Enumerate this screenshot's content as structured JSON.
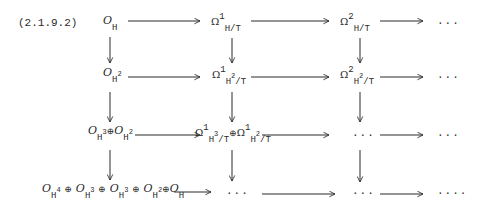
{
  "equation_label": "(2.1.9.2)",
  "diagram": {
    "type": "commutative-diagram",
    "rows": [
      {
        "nodes": [
          {
            "main": "O",
            "sub": "H",
            "sub_sup": ""
          },
          {
            "main": "Ω",
            "sup": "1",
            "sub": "H/T"
          },
          {
            "main": "Ω",
            "sup": "2",
            "sub": "H/T"
          },
          {
            "text": "..."
          }
        ]
      },
      {
        "nodes": [
          {
            "main": "O",
            "sub": "H",
            "sub_sup": "2"
          },
          {
            "main": "Ω",
            "sup": "1",
            "sub": "H",
            "sub_sup": "2",
            "sub_tail": "/T"
          },
          {
            "main": "Ω",
            "sup": "2",
            "sub": "H",
            "sub_sup": "2",
            "sub_tail": "/T"
          },
          {
            "text": "..."
          }
        ]
      },
      {
        "nodes": [
          {
            "text": "O_{H^3} ⊕ O_{H^2}"
          },
          {
            "text": "Ω¹_{H^3/T} ⊕ Ω¹_{H^2/T}"
          },
          {
            "text": "..."
          },
          {
            "text": "..."
          }
        ]
      },
      {
        "nodes": [
          {
            "text": "O_{H^4} ⊕ O_{H^3} ⊕ O_{H^3} ⊕ O_{H^2} ⊕ O_H"
          },
          {
            "text": "..."
          },
          {
            "text": "..."
          },
          {
            "text": "...."
          }
        ]
      }
    ],
    "symbols": {
      "O": "O",
      "Omega": "Ω",
      "H": "H",
      "T": "T",
      "oplus": "⊕",
      "slash_T": "/T",
      "dots": "...",
      "dots_end": "...."
    },
    "sups": {
      "one": "1",
      "two": "2",
      "three": "3",
      "four": "4"
    },
    "arrows": {
      "horizontal_per_row": 3,
      "vertical_per_column": 3,
      "columns_with_verticals": 3
    }
  }
}
